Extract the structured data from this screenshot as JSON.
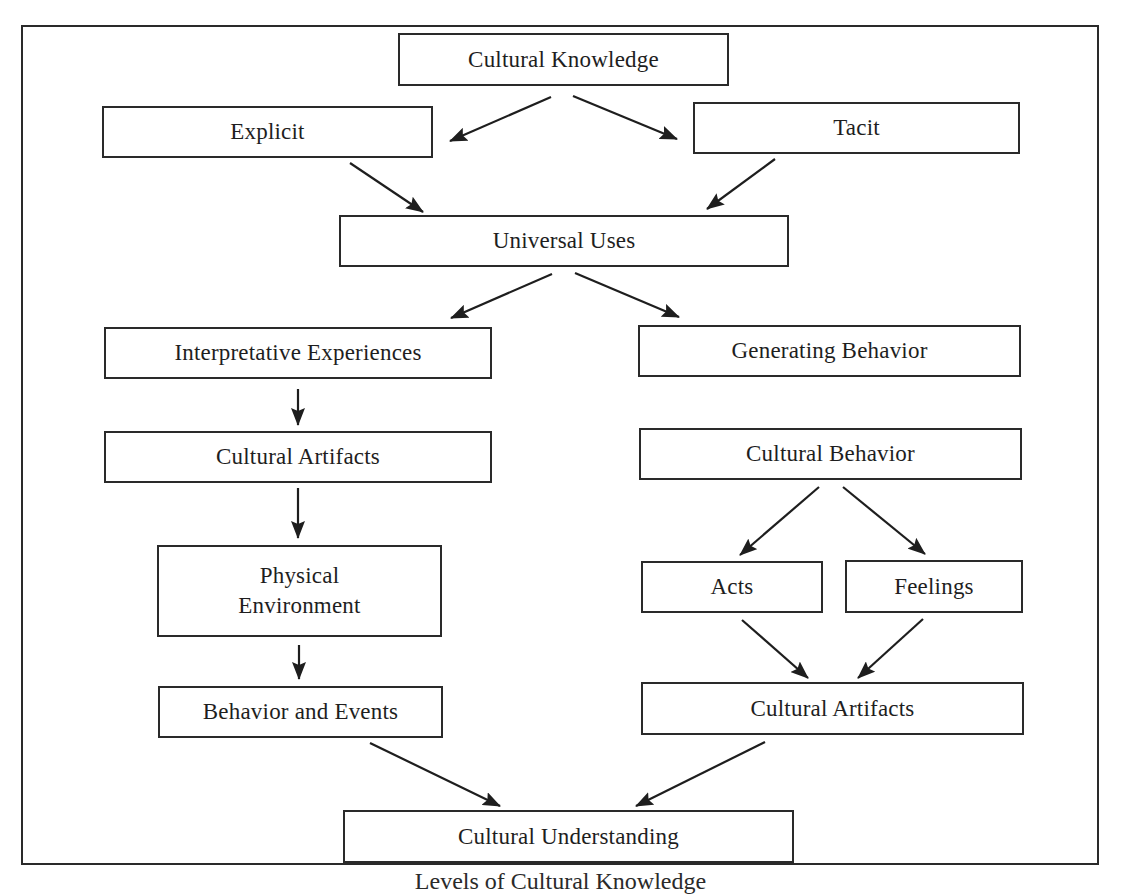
{
  "diagram": {
    "type": "flowchart",
    "caption": "Levels of Cultural Knowledge",
    "colors": {
      "stroke": "#2a2a2a",
      "text": "#1e1e1e",
      "background": "#ffffff"
    },
    "nodes": {
      "cultural_knowledge": {
        "label": "Cultural Knowledge"
      },
      "explicit": {
        "label": "Explicit"
      },
      "tacit": {
        "label": "Tacit"
      },
      "universal_uses": {
        "label": "Universal Uses"
      },
      "interpretative_experiences": {
        "label": "Interpretative Experiences"
      },
      "generating_behavior": {
        "label": "Generating Behavior"
      },
      "cultural_artifacts_left": {
        "label": "Cultural Artifacts"
      },
      "cultural_behavior": {
        "label": "Cultural Behavior"
      },
      "physical_environment": {
        "line1": "Physical",
        "line2": "Environment"
      },
      "acts": {
        "label": "Acts"
      },
      "feelings": {
        "label": "Feelings"
      },
      "behavior_and_events": {
        "label": "Behavior and Events"
      },
      "cultural_artifacts_right": {
        "label": "Cultural Artifacts"
      },
      "cultural_understanding": {
        "label": "Cultural Understanding"
      }
    },
    "edges": [
      {
        "from": "cultural_knowledge",
        "to": "explicit"
      },
      {
        "from": "cultural_knowledge",
        "to": "tacit"
      },
      {
        "from": "explicit",
        "to": "universal_uses"
      },
      {
        "from": "tacit",
        "to": "universal_uses"
      },
      {
        "from": "universal_uses",
        "to": "interpretative_experiences"
      },
      {
        "from": "universal_uses",
        "to": "generating_behavior"
      },
      {
        "from": "interpretative_experiences",
        "to": "cultural_artifacts_left"
      },
      {
        "from": "cultural_artifacts_left",
        "to": "physical_environment"
      },
      {
        "from": "physical_environment",
        "to": "behavior_and_events"
      },
      {
        "from": "cultural_behavior",
        "to": "acts"
      },
      {
        "from": "cultural_behavior",
        "to": "feelings"
      },
      {
        "from": "acts",
        "to": "cultural_artifacts_right"
      },
      {
        "from": "feelings",
        "to": "cultural_artifacts_right"
      },
      {
        "from": "behavior_and_events",
        "to": "cultural_understanding"
      },
      {
        "from": "cultural_artifacts_right",
        "to": "cultural_understanding"
      }
    ]
  }
}
